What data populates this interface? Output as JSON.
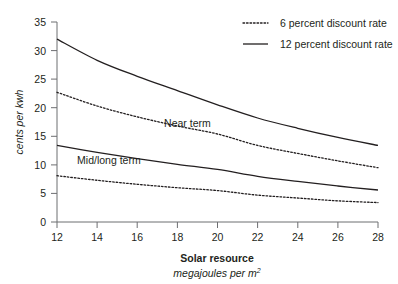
{
  "chart_data": {
    "type": "line",
    "title": "",
    "xlabel": "Solar resource",
    "xlabel_sub": "megajoules per m",
    "xlabel_sub_exponent": "2",
    "ylabel": "cents per kwh",
    "xlim": [
      12,
      28
    ],
    "ylim": [
      0,
      35
    ],
    "grid": false,
    "legend_position": "top-right",
    "x_ticks": [
      "12",
      "14",
      "16",
      "18",
      "20",
      "22",
      "24",
      "26",
      "28"
    ],
    "x_tick_values": [
      12,
      14,
      16,
      18,
      20,
      22,
      24,
      26,
      28
    ],
    "y_ticks": [
      "0",
      "5",
      "10",
      "15",
      "20",
      "25",
      "30",
      "35"
    ],
    "y_tick_values": [
      0,
      5,
      10,
      15,
      20,
      25,
      30,
      35
    ],
    "x": [
      12,
      14,
      16,
      18,
      20,
      22,
      24,
      26,
      28
    ],
    "series": [
      {
        "name": "Near term, 12 percent discount rate",
        "style": "solid",
        "group": "Near term",
        "values": [
          32.0,
          28.3,
          25.5,
          23.0,
          20.5,
          18.2,
          16.4,
          14.8,
          13.4
        ]
      },
      {
        "name": "Near term, 6 percent discount rate",
        "style": "dotted",
        "group": "Near term",
        "values": [
          22.7,
          20.3,
          18.4,
          16.8,
          15.4,
          13.4,
          12.0,
          10.7,
          9.5
        ]
      },
      {
        "name": "Mid/long term, 12 percent discount rate",
        "style": "solid",
        "group": "Mid/long term",
        "values": [
          13.4,
          12.2,
          11.1,
          10.1,
          9.2,
          8.0,
          7.1,
          6.3,
          5.6
        ]
      },
      {
        "name": "Mid/long term, 6 percent discount rate",
        "style": "dotted",
        "group": "Mid/long term",
        "values": [
          8.1,
          7.3,
          6.6,
          6.0,
          5.5,
          4.7,
          4.2,
          3.7,
          3.4
        ]
      }
    ],
    "annotations": [
      {
        "text": "Near term",
        "x": 18.5,
        "y": 16.6
      },
      {
        "text": "Mid/long term",
        "x": 13.0,
        "y": 10.2
      }
    ],
    "legend": [
      {
        "label": "6 percent discount rate",
        "style": "dotted"
      },
      {
        "label": "12 percent discount rate",
        "style": "solid"
      }
    ],
    "colors": {
      "line": "#231f20",
      "axis": "#6d6e71",
      "background": "#ffffff"
    }
  }
}
